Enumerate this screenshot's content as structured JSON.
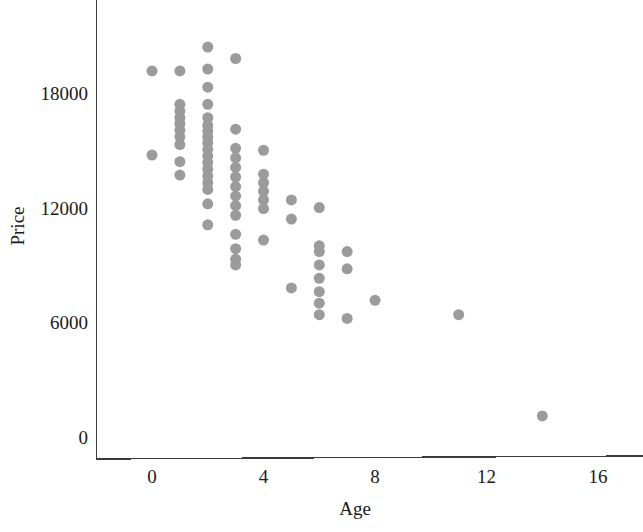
{
  "chart_data": {
    "type": "scatter",
    "title": "",
    "subtitle": "",
    "xlabel": "Age",
    "ylabel": "Price",
    "xlim": [
      -1.9,
      17.6
    ],
    "ylim": [
      -1250,
      21200
    ],
    "xticks": [
      0,
      4,
      8,
      12,
      16
    ],
    "xticklabels": [
      "0",
      "4",
      "8",
      "12",
      "16"
    ],
    "yticks": [
      0,
      6000,
      12000,
      18000
    ],
    "yticklabels": [
      "0",
      "6000",
      "12000",
      "18000"
    ],
    "grid": false,
    "legend": null,
    "marker": {
      "shape": "circle",
      "color": "#9b9b9b",
      "size_px": 11,
      "opacity": 1
    },
    "annotations": [],
    "n_points": 74,
    "x": [
      0,
      0,
      1,
      1,
      1,
      1,
      1,
      1,
      1,
      1,
      1,
      1,
      2,
      2,
      2,
      2,
      2,
      2,
      2,
      2,
      2,
      2,
      2,
      2,
      2,
      2,
      2,
      2,
      2,
      2,
      3,
      3,
      3,
      3,
      3,
      3,
      3,
      3,
      3,
      3,
      3,
      3,
      3,
      3,
      4,
      4,
      4,
      4,
      4,
      4,
      4,
      5,
      5,
      5,
      6,
      6,
      6,
      6,
      6,
      6,
      6,
      6,
      7,
      7,
      7,
      8,
      11,
      14
    ],
    "y": [
      19150,
      14750,
      19150,
      17400,
      17050,
      16700,
      16400,
      16050,
      15700,
      15300,
      14400,
      13700,
      20400,
      19250,
      18300,
      17400,
      16700,
      16300,
      16000,
      15700,
      15400,
      15050,
      14700,
      14350,
      14000,
      13650,
      13300,
      12950,
      12200,
      11100,
      19800,
      16100,
      15100,
      14600,
      14100,
      13600,
      13100,
      12600,
      12100,
      11600,
      10600,
      9850,
      9300,
      9000,
      15000,
      13750,
      13300,
      12850,
      12400,
      11950,
      10300,
      12400,
      11400,
      7800,
      12000,
      10000,
      9700,
      9000,
      8300,
      7600,
      7000,
      6400,
      9700,
      8800,
      6200,
      7150,
      6400,
      1100
    ],
    "points_by_age": [
      {
        "age": 0,
        "prices": [
          19150,
          14750
        ]
      },
      {
        "age": 1,
        "prices": [
          19150,
          17400,
          17050,
          16700,
          16400,
          16050,
          15700,
          15300,
          14400,
          13700
        ]
      },
      {
        "age": 2,
        "prices": [
          20400,
          19250,
          18300,
          17400,
          16700,
          16300,
          16000,
          15700,
          15400,
          15050,
          14700,
          14350,
          14000,
          13650,
          13300,
          12950,
          12200,
          11100
        ]
      },
      {
        "age": 3,
        "prices": [
          19800,
          16100,
          15100,
          14600,
          14100,
          13600,
          13100,
          12600,
          12100,
          11600,
          10600,
          9850,
          9300,
          9000
        ]
      },
      {
        "age": 4,
        "prices": [
          15000,
          13750,
          13300,
          12850,
          12400,
          11950,
          10300
        ]
      },
      {
        "age": 5,
        "prices": [
          12400,
          11400,
          7800
        ]
      },
      {
        "age": 6,
        "prices": [
          12000,
          10000,
          9700,
          9000,
          8300,
          7600,
          7000,
          6400
        ]
      },
      {
        "age": 7,
        "prices": [
          9700,
          8800,
          6200
        ]
      },
      {
        "age": 8,
        "prices": [
          7150
        ]
      },
      {
        "age": 11,
        "prices": [
          6400
        ]
      },
      {
        "age": 14,
        "prices": [
          1100
        ]
      }
    ]
  },
  "figure": {
    "background_color": "#ffffff",
    "axis_color": "#3a3a3a",
    "text_color": "#1a1a1a"
  }
}
